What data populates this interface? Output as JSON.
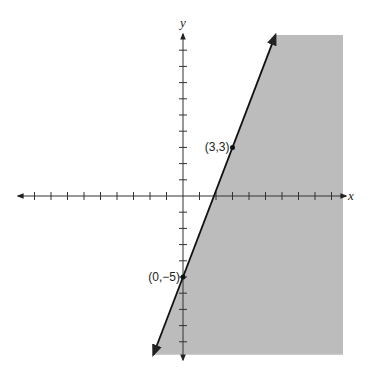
{
  "chart_data": {
    "type": "line",
    "title": "",
    "xlabel": "x",
    "ylabel": "y",
    "xlim": [
      -10,
      10
    ],
    "ylim": [
      -10,
      10
    ],
    "x_ticks": [
      -9,
      -8,
      -7,
      -6,
      -5,
      -4,
      -3,
      -2,
      -1,
      1,
      2,
      3,
      4,
      5,
      6,
      7,
      8,
      9
    ],
    "y_ticks": [
      -9,
      -8,
      -7,
      -6,
      -5,
      -4,
      -3,
      -2,
      -1,
      1,
      2,
      3,
      4,
      5,
      6,
      7,
      8,
      9
    ],
    "grid": false,
    "boundary_line": {
      "equation": "y = (8/3)x - 5",
      "slope": 2.6667,
      "intercept": -5,
      "style": "solid",
      "arrows": "both",
      "x_range": [
        -1.8,
        5.6
      ]
    },
    "shaded_region": {
      "description": "half-plane to the right of / below the line",
      "inequality": "y < (8/3)x - 5",
      "color": "#bcbcbc"
    },
    "points": [
      {
        "x": 3,
        "y": 3,
        "label": "(3,3)"
      },
      {
        "x": 0,
        "y": -5,
        "label": "(0,−5)"
      }
    ]
  }
}
